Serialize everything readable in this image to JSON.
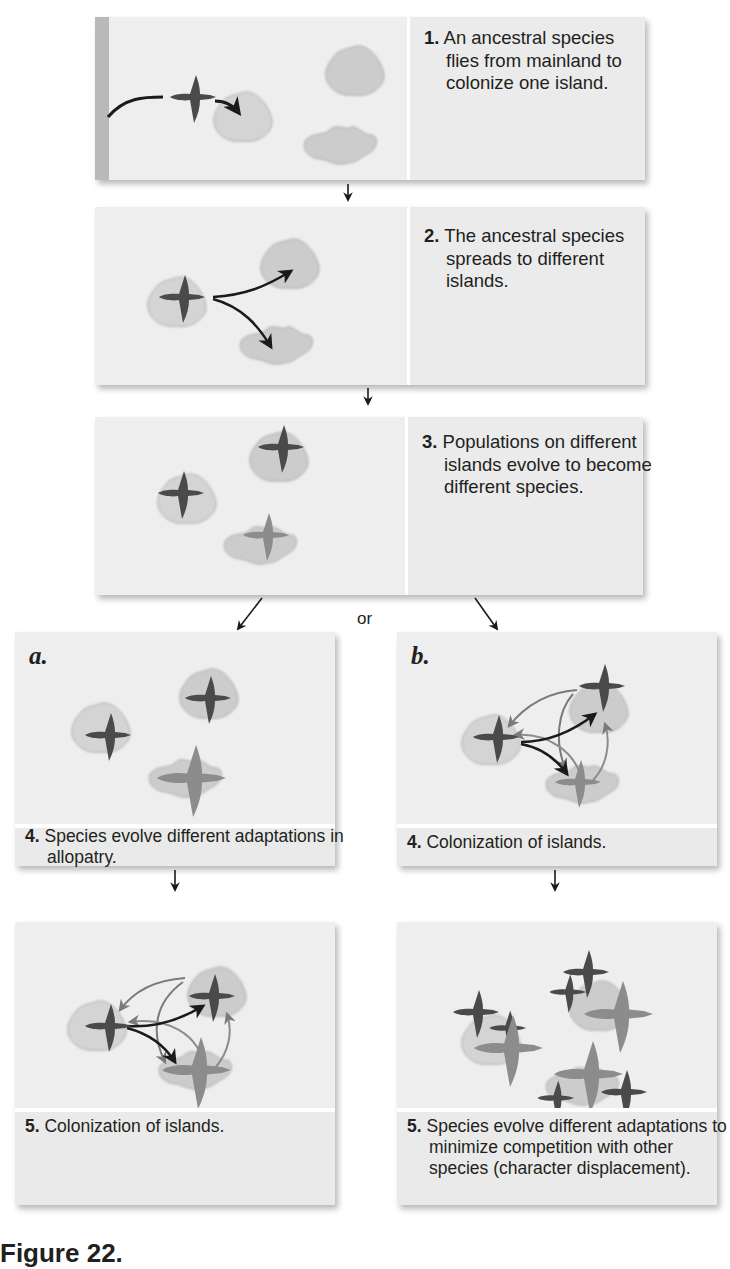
{
  "figure": {
    "caption_fragment": "Figure 22.",
    "colors": {
      "panel_bg": "#ececec",
      "island": "#c8c8c8",
      "bird_dark": "#4a4a4a",
      "bird_light": "#8c8c8c",
      "arrow_dark": "#1a1a1a",
      "arrow_gray": "#7a7a7a",
      "text": "#231f20"
    }
  },
  "steps": [
    {
      "number": "1.",
      "text": "An ancestral species flies from mainland to colonize one island."
    },
    {
      "number": "2.",
      "text": "The ancestral species spreads to different islands."
    },
    {
      "number": "3.",
      "text": "Populations on different islands evolve to become different species."
    }
  ],
  "branch_label": "or",
  "branches": {
    "a": {
      "letter": "a.",
      "step4": {
        "number": "4.",
        "text": "Species evolve different adaptations in allopatry."
      },
      "step5": {
        "number": "5.",
        "text": "Colonization of islands."
      }
    },
    "b": {
      "letter": "b.",
      "step4": {
        "number": "4.",
        "text": "Colonization of islands."
      },
      "step5": {
        "number": "5.",
        "text": "Species evolve different adaptations to minimize competition with other species (character displacement)."
      }
    }
  }
}
